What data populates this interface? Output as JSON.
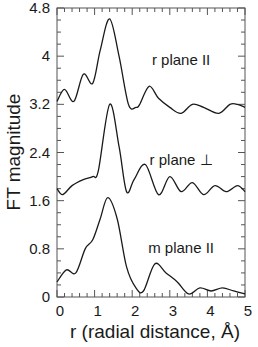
{
  "chart_data": {
    "type": "line",
    "title": "",
    "xlabel": "r (radial distance, Å)",
    "ylabel": "FT magnitude",
    "xlim": [
      0,
      5
    ],
    "ylim": [
      0,
      4.8
    ],
    "x_ticks": [
      "0",
      "1",
      "2",
      "3",
      "4",
      "5"
    ],
    "y_ticks": [
      "0",
      "0.8",
      "1.6",
      "2.4",
      "3.2",
      "4",
      "4.8"
    ],
    "grid": false,
    "legend": null,
    "annotations": [
      {
        "text": "r plane II",
        "x": 3.3,
        "y": 3.85
      },
      {
        "text": "r plane ⊥",
        "x": 3.3,
        "y": 2.2
      },
      {
        "text": "m plane II",
        "x": 3.3,
        "y": 0.73
      }
    ],
    "series": [
      {
        "name": "r plane II",
        "x": [
          0.0,
          0.2,
          0.45,
          0.7,
          0.95,
          1.15,
          1.4,
          1.65,
          1.9,
          2.1,
          2.2,
          2.45,
          2.7,
          3.0,
          3.3,
          3.6,
          3.9,
          4.3,
          4.6,
          4.8,
          5.0
        ],
        "values": [
          3.25,
          3.45,
          3.25,
          3.7,
          3.55,
          4.1,
          4.62,
          4.0,
          3.2,
          3.15,
          3.2,
          3.5,
          3.3,
          3.15,
          3.05,
          3.2,
          3.15,
          3.05,
          3.2,
          3.2,
          3.15
        ]
      },
      {
        "name": "r plane ⊥",
        "x": [
          0.0,
          0.15,
          0.4,
          0.7,
          0.95,
          1.1,
          1.4,
          1.65,
          1.85,
          2.05,
          2.35,
          2.7,
          3.0,
          3.3,
          3.6,
          3.9,
          4.2,
          4.5,
          4.8,
          5.0
        ],
        "values": [
          1.8,
          1.7,
          1.85,
          1.95,
          2.0,
          2.1,
          3.2,
          2.5,
          1.75,
          1.95,
          2.2,
          1.7,
          2.0,
          1.75,
          1.9,
          1.7,
          1.85,
          1.75,
          1.85,
          1.75
        ]
      },
      {
        "name": "m plane II",
        "x": [
          0.0,
          0.25,
          0.5,
          0.75,
          0.95,
          1.15,
          1.35,
          1.6,
          1.85,
          2.1,
          2.3,
          2.6,
          2.9,
          3.2,
          3.5,
          3.8,
          4.1,
          4.4,
          4.7,
          5.0
        ],
        "values": [
          0.25,
          0.45,
          0.4,
          0.8,
          0.95,
          1.3,
          1.65,
          1.3,
          0.5,
          0.15,
          0.1,
          0.55,
          0.4,
          0.25,
          0.05,
          0.15,
          0.1,
          0.15,
          0.1,
          0.05
        ]
      }
    ]
  }
}
